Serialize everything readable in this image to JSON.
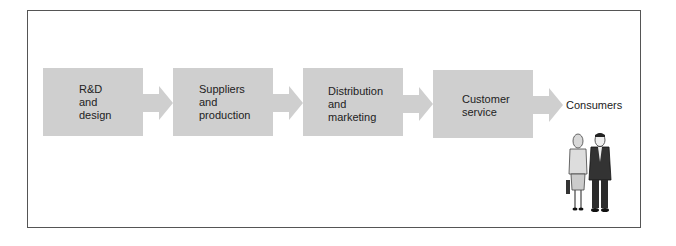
{
  "diagram": {
    "type": "value-chain flow",
    "steps": [
      {
        "label": "R&D\nand\ndesign"
      },
      {
        "label": "Suppliers\nand\nproduction"
      },
      {
        "label": "Distribution\nand\nmarketing"
      },
      {
        "label": "Customer\nservice"
      }
    ],
    "end_label": "Consumers",
    "colors": {
      "box": "#cfcfcf",
      "arrow": "#cfcfcf",
      "border": "#555555"
    }
  }
}
